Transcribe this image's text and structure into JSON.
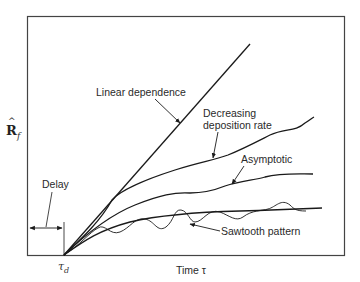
{
  "diagram": {
    "y_axis_label": "R",
    "y_axis_hat": "^",
    "y_axis_subscript": "f",
    "x_axis_label": "Time τ",
    "origin_label": "τ",
    "origin_subscript": "d",
    "delay_label": "Delay",
    "curves": [
      {
        "name": "Linear dependence",
        "label": "Linear dependence"
      },
      {
        "name": "Decreasing deposition rate",
        "label_line1": "Decreasing",
        "label_line2": "deposition rate"
      },
      {
        "name": "Asymptotic",
        "label": "Asymptotic"
      },
      {
        "name": "Sawtooth pattern",
        "label": "Sawtooth  pattern"
      }
    ],
    "colors": {
      "line": "#1a1a1a",
      "frame": "#333333",
      "text": "#2a2a2a"
    }
  }
}
